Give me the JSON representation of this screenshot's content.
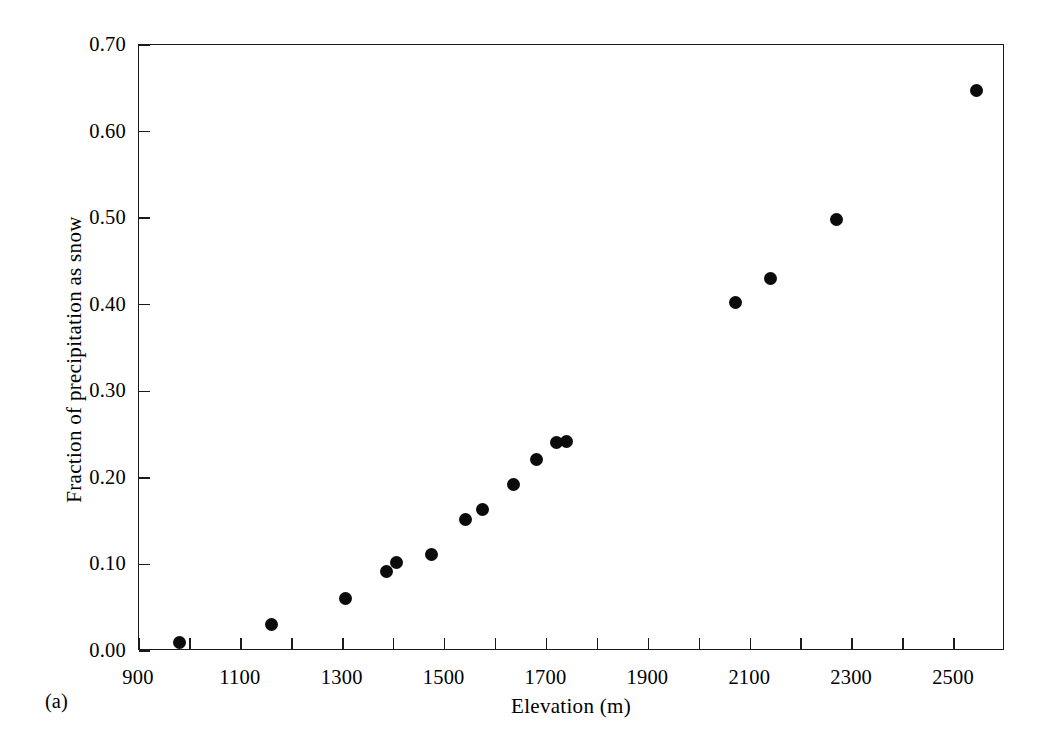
{
  "figure": {
    "panel_label": "(a)"
  },
  "chart_data": {
    "type": "scatter",
    "title": "",
    "xlabel": "Elevation (m)",
    "ylabel": "Fraction of precipitation as snow",
    "xlim": [
      900,
      2600
    ],
    "ylim": [
      0.0,
      0.7
    ],
    "xticks": [
      900,
      1000,
      1100,
      1200,
      1300,
      1400,
      1500,
      1600,
      1700,
      1800,
      1900,
      2000,
      2100,
      2200,
      2300,
      2400,
      2500
    ],
    "xtick_labels": [
      "900",
      "",
      "1100",
      "",
      "1300",
      "",
      "1500",
      "",
      "1700",
      "",
      "1900",
      "",
      "2100",
      "",
      "2300",
      "",
      "2500"
    ],
    "yticks": [
      0.0,
      0.1,
      0.2,
      0.3,
      0.4,
      0.5,
      0.6,
      0.7
    ],
    "ytick_labels": [
      "0.00",
      "0.10",
      "0.20",
      "0.30",
      "0.40",
      "0.50",
      "0.60",
      "0.70"
    ],
    "grid": false,
    "legend": false,
    "marker": "filled-circle",
    "marker_color": "#0b0b0b",
    "axis_color": "#1a1a1a",
    "x": [
      980,
      1160,
      1305,
      1385,
      1405,
      1475,
      1540,
      1575,
      1635,
      1680,
      1720,
      1740,
      2070,
      2140,
      2270,
      2545
    ],
    "y": [
      0.01,
      0.031,
      0.061,
      0.092,
      0.102,
      0.111,
      0.152,
      0.164,
      0.192,
      0.221,
      0.241,
      0.242,
      0.403,
      0.43,
      0.499,
      0.647
    ],
    "points": [
      {
        "x": 980,
        "y": 0.01
      },
      {
        "x": 1160,
        "y": 0.031
      },
      {
        "x": 1305,
        "y": 0.061
      },
      {
        "x": 1385,
        "y": 0.092
      },
      {
        "x": 1405,
        "y": 0.102
      },
      {
        "x": 1475,
        "y": 0.111
      },
      {
        "x": 1540,
        "y": 0.152
      },
      {
        "x": 1575,
        "y": 0.164
      },
      {
        "x": 1635,
        "y": 0.192
      },
      {
        "x": 1680,
        "y": 0.221
      },
      {
        "x": 1720,
        "y": 0.241
      },
      {
        "x": 1740,
        "y": 0.242
      },
      {
        "x": 2070,
        "y": 0.403
      },
      {
        "x": 2140,
        "y": 0.43
      },
      {
        "x": 2270,
        "y": 0.499
      },
      {
        "x": 2545,
        "y": 0.647
      }
    ]
  }
}
